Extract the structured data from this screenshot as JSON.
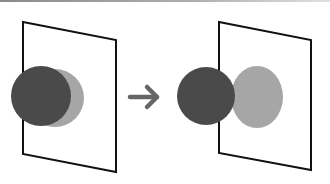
{
  "diagram": {
    "colors": {
      "background": "#ffffff",
      "plane_stroke": "#111111",
      "dark_circle": "#4a4a4a",
      "light_circle": "#a6a6a6",
      "arrow": "#666666",
      "top_strip": "#8a8a8a"
    },
    "panels": [
      {
        "id": "before",
        "plane": {
          "points": "23,22 116,40 116,172 23,154"
        },
        "dark_circle": {
          "cx": 41,
          "cy": 96,
          "r": 30
        },
        "light_circle": {
          "cx": 55,
          "cy": 98,
          "rx": 29,
          "ry": 29
        }
      },
      {
        "id": "after",
        "plane": {
          "points": "219,22 311,40 311,170 219,153"
        },
        "dark_circle": {
          "cx": 206,
          "cy": 96,
          "r": 29
        },
        "light_circle": {
          "cx": 257,
          "cy": 97,
          "rx": 26,
          "ry": 31
        }
      }
    ],
    "arrow": {
      "symbol": "→",
      "direction": "right",
      "x1": 130,
      "y1": 97,
      "x2": 158,
      "y2": 97
    }
  }
}
